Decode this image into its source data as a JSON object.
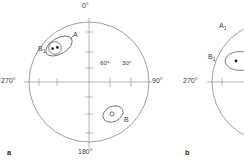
{
  "figure": {
    "type": "stereographic-projection-pair",
    "background": "#ffffff",
    "line_color": "#6e6e6e",
    "text_color": "#3a3a3a"
  },
  "panel_a": {
    "tag": "a",
    "net": {
      "cx": 89,
      "cy": 82,
      "r": 60
    },
    "azimuth_labels": {
      "north": "0°",
      "east": "90°",
      "south": "180°",
      "west": "270°"
    },
    "inclination_labels": [
      {
        "text": "60°",
        "x": 106,
        "y": 64
      },
      {
        "text": "30°",
        "x": 124,
        "y": 64
      }
    ],
    "clusters": [
      {
        "id": "A",
        "label": "A",
        "label_x": 72,
        "label_y": 33,
        "ellipse": {
          "cx": 59,
          "cy": 46,
          "rx": 14,
          "ry": 8,
          "rot": -30
        },
        "inner_circle": {
          "cx": 55,
          "cy": 48,
          "r": 6.2
        },
        "points": [
          {
            "x": 52.5,
            "y": 48.5,
            "filled": true
          },
          {
            "x": 57.5,
            "y": 47.5,
            "filled": true
          }
        ]
      },
      {
        "id": "B1",
        "label": "B₁",
        "label_text": "B",
        "label_sub": "1",
        "label_x": 40,
        "label_y": 48
      },
      {
        "id": "B",
        "label": "B",
        "label_x": 125,
        "label_y": 119,
        "ellipse": {
          "cx": 113,
          "cy": 114,
          "rx": 10.5,
          "ry": 7.5,
          "rot": -25
        },
        "points": [
          {
            "x": 112,
            "y": 114,
            "filled": false
          }
        ]
      }
    ]
  },
  "panel_b": {
    "tag": "b",
    "net": {
      "cx": 272,
      "cy": 82,
      "r": 60
    },
    "azimuth_labels": {
      "west": "270°"
    },
    "clusters": [
      {
        "id": "A",
        "label": "A",
        "label_text": "A",
        "label_sub": "1",
        "label_x": 220,
        "label_y": 26
      },
      {
        "id": "B1",
        "label": "B₁",
        "label_text": "B",
        "label_sub": "1",
        "label_x": 210,
        "label_y": 56,
        "ellipse": {
          "cx": 238,
          "cy": 61,
          "rx": 14,
          "ry": 9,
          "rot": 0
        },
        "points": [
          {
            "x": 235,
            "y": 61,
            "filled": true
          }
        ]
      }
    ]
  }
}
